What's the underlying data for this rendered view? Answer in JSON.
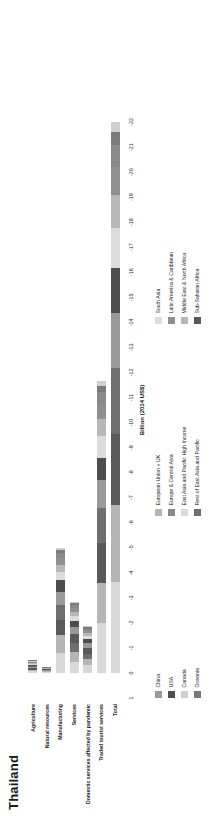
{
  "title": "Thailand",
  "axis": {
    "label": "Billion (2014 US$)",
    "ticks": [
      "1",
      "0",
      "-1",
      "-2",
      "-3",
      "-4",
      "-5",
      "-6",
      "-7",
      "-8",
      "-9",
      "-10",
      "-11",
      "-12",
      "-13",
      "-14",
      "-15",
      "-16",
      "-17",
      "-18",
      "-19",
      "-20",
      "-21",
      "-22"
    ],
    "min": -22,
    "max": 1
  },
  "categories": [
    "Agriculture",
    "Natural resources",
    "Manufacturing",
    "Services",
    "Domestic services affected by pandemic",
    "Traded tourist services",
    "Total"
  ],
  "legend": {
    "columns": [
      {
        "items": [
          {
            "label": "China",
            "color": "#9a9a9a"
          },
          {
            "label": "USA",
            "color": "#4d4d4d"
          },
          {
            "label": "Canada",
            "color": "#cfcfcf"
          },
          {
            "label": "Oceania",
            "color": "#7a7a7a"
          }
        ]
      },
      {
        "items": [
          {
            "label": "European Union + UK",
            "color": "#b5b5b5"
          },
          {
            "label": "Europe & Central Asia",
            "color": "#8a8a8a"
          },
          {
            "label": "East Asia and Pacific High Income",
            "color": "#d9d9d9"
          },
          {
            "label": "Rest of East Asia and Pacific",
            "color": "#6e6e6e"
          }
        ]
      },
      {
        "items": [
          {
            "label": "South Asia",
            "color": "#dcdcdc"
          },
          {
            "label": "Latin America & Caribbean",
            "color": "#8f8f8f"
          },
          {
            "label": "Middle East & North Africa",
            "color": "#b8b8b8"
          },
          {
            "label": "Sub-Saharan Africa",
            "color": "#595959"
          }
        ]
      }
    ]
  },
  "chart_data": {
    "type": "bar",
    "orientation": "horizontal",
    "stacked": true,
    "title": "Thailand",
    "xlabel": "Billion (2014 US$)",
    "ylabel": "",
    "xlim": [
      -22,
      1
    ],
    "grid": false,
    "legend_position": "bottom",
    "categories": [
      "Agriculture",
      "Natural resources",
      "Manufacturing",
      "Services",
      "Domestic services affected by pandemic",
      "Traded tourist services",
      "Total"
    ],
    "series": [
      {
        "name": "China",
        "color": "#9a9a9a",
        "values": [
          -0.05,
          -0.02,
          -0.55,
          -0.3,
          -0.2,
          -1.1,
          -2.2
        ]
      },
      {
        "name": "USA",
        "color": "#4d4d4d",
        "values": [
          -0.04,
          -0.02,
          -0.45,
          -0.25,
          -0.15,
          -0.9,
          -1.8
        ]
      },
      {
        "name": "Canada",
        "color": "#cfcfcf",
        "values": [
          -0.01,
          -0.01,
          -0.1,
          -0.06,
          -0.04,
          -0.2,
          -0.42
        ]
      },
      {
        "name": "Oceania",
        "color": "#7a7a7a",
        "values": [
          -0.01,
          -0.01,
          -0.12,
          -0.07,
          -0.05,
          -0.25,
          -0.51
        ]
      },
      {
        "name": "European Union + UK",
        "color": "#b5b5b5",
        "values": [
          -0.06,
          -0.03,
          -0.7,
          -0.4,
          -0.25,
          -1.6,
          -3.04
        ]
      },
      {
        "name": "Europe & Central Asia",
        "color": "#8a8a8a",
        "values": [
          -0.02,
          -0.01,
          -0.2,
          -0.12,
          -0.08,
          -0.45,
          -0.88
        ]
      },
      {
        "name": "East Asia and Pacific High Income",
        "color": "#d9d9d9",
        "values": [
          -0.07,
          -0.03,
          -0.8,
          -0.45,
          -0.3,
          -2.0,
          -3.65
        ]
      },
      {
        "name": "Rest of East Asia and Pacific",
        "color": "#6e6e6e",
        "values": [
          -0.05,
          -0.02,
          -0.6,
          -0.35,
          -0.22,
          -1.4,
          -2.64
        ]
      },
      {
        "name": "South Asia",
        "color": "#dcdcdc",
        "values": [
          -0.04,
          -0.02,
          -0.35,
          -0.2,
          -0.14,
          -0.85,
          -1.6
        ]
      },
      {
        "name": "Latin America & Caribbean",
        "color": "#8f8f8f",
        "values": [
          -0.03,
          -0.01,
          -0.25,
          -0.15,
          -0.1,
          -0.6,
          -1.14
        ]
      },
      {
        "name": "Middle East & North Africa",
        "color": "#b8b8b8",
        "values": [
          -0.03,
          -0.01,
          -0.28,
          -0.16,
          -0.11,
          -0.7,
          -1.29
        ]
      },
      {
        "name": "Sub-Saharan Africa",
        "color": "#595959",
        "values": [
          -0.06,
          -0.03,
          -0.6,
          -0.34,
          -0.22,
          -1.6,
          -2.85
        ]
      }
    ],
    "totals": [
      -0.47,
      -0.22,
      -5.0,
      -2.85,
      -1.86,
      -11.65,
      -22.02
    ]
  },
  "bar_rows": [
    {
      "category": "Agriculture",
      "segments": [
        {
          "series": "East Asia and Pacific High Income",
          "color": "#d9d9d9",
          "value": -0.07
        },
        {
          "series": "European Union + UK",
          "color": "#b5b5b5",
          "value": -0.06
        },
        {
          "series": "Sub-Saharan Africa",
          "color": "#595959",
          "value": -0.06
        },
        {
          "series": "China",
          "color": "#9a9a9a",
          "value": -0.05
        },
        {
          "series": "Rest of East Asia and Pacific",
          "color": "#6e6e6e",
          "value": -0.05
        },
        {
          "series": "USA",
          "color": "#4d4d4d",
          "value": -0.04
        },
        {
          "series": "South Asia",
          "color": "#dcdcdc",
          "value": -0.04
        },
        {
          "series": "Middle East & North Africa",
          "color": "#b8b8b8",
          "value": -0.03
        },
        {
          "series": "Latin America & Caribbean",
          "color": "#8f8f8f",
          "value": -0.03
        },
        {
          "series": "Europe & Central Asia",
          "color": "#8a8a8a",
          "value": -0.02
        },
        {
          "series": "Canada",
          "color": "#cfcfcf",
          "value": -0.01
        },
        {
          "series": "Oceania",
          "color": "#7a7a7a",
          "value": -0.01
        }
      ]
    },
    {
      "category": "Natural resources",
      "segments": [
        {
          "series": "East Asia and Pacific High Income",
          "color": "#d9d9d9",
          "value": -0.03
        },
        {
          "series": "European Union + UK",
          "color": "#b5b5b5",
          "value": -0.03
        },
        {
          "series": "Sub-Saharan Africa",
          "color": "#595959",
          "value": -0.03
        },
        {
          "series": "China",
          "color": "#9a9a9a",
          "value": -0.02
        },
        {
          "series": "Rest of East Asia and Pacific",
          "color": "#6e6e6e",
          "value": -0.02
        },
        {
          "series": "USA",
          "color": "#4d4d4d",
          "value": -0.02
        },
        {
          "series": "South Asia",
          "color": "#dcdcdc",
          "value": -0.02
        },
        {
          "series": "Middle East & North Africa",
          "color": "#b8b8b8",
          "value": -0.01
        },
        {
          "series": "Latin America & Caribbean",
          "color": "#8f8f8f",
          "value": -0.01
        },
        {
          "series": "Europe & Central Asia",
          "color": "#8a8a8a",
          "value": -0.01
        },
        {
          "series": "Canada",
          "color": "#cfcfcf",
          "value": -0.01
        },
        {
          "series": "Oceania",
          "color": "#7a7a7a",
          "value": -0.01
        }
      ]
    },
    {
      "category": "Manufacturing",
      "segments": [
        {
          "series": "East Asia and Pacific High Income",
          "color": "#d9d9d9",
          "value": -0.8
        },
        {
          "series": "European Union + UK",
          "color": "#b5b5b5",
          "value": -0.7
        },
        {
          "series": "Sub-Saharan Africa",
          "color": "#595959",
          "value": -0.6
        },
        {
          "series": "Rest of East Asia and Pacific",
          "color": "#6e6e6e",
          "value": -0.6
        },
        {
          "series": "China",
          "color": "#9a9a9a",
          "value": -0.55
        },
        {
          "series": "USA",
          "color": "#4d4d4d",
          "value": -0.45
        },
        {
          "series": "South Asia",
          "color": "#dcdcdc",
          "value": -0.35
        },
        {
          "series": "Middle East & North Africa",
          "color": "#b8b8b8",
          "value": -0.28
        },
        {
          "series": "Latin America & Caribbean",
          "color": "#8f8f8f",
          "value": -0.25
        },
        {
          "series": "Europe & Central Asia",
          "color": "#8a8a8a",
          "value": -0.2
        },
        {
          "series": "Oceania",
          "color": "#7a7a7a",
          "value": -0.12
        },
        {
          "series": "Canada",
          "color": "#cfcfcf",
          "value": -0.1
        }
      ]
    },
    {
      "category": "Services",
      "segments": [
        {
          "series": "East Asia and Pacific High Income",
          "color": "#d9d9d9",
          "value": -0.45
        },
        {
          "series": "European Union + UK",
          "color": "#b5b5b5",
          "value": -0.4
        },
        {
          "series": "Rest of East Asia and Pacific",
          "color": "#6e6e6e",
          "value": -0.35
        },
        {
          "series": "Sub-Saharan Africa",
          "color": "#595959",
          "value": -0.34
        },
        {
          "series": "China",
          "color": "#9a9a9a",
          "value": -0.3
        },
        {
          "series": "USA",
          "color": "#4d4d4d",
          "value": -0.25
        },
        {
          "series": "South Asia",
          "color": "#dcdcdc",
          "value": -0.2
        },
        {
          "series": "Middle East & North Africa",
          "color": "#b8b8b8",
          "value": -0.16
        },
        {
          "series": "Latin America & Caribbean",
          "color": "#8f8f8f",
          "value": -0.15
        },
        {
          "series": "Europe & Central Asia",
          "color": "#8a8a8a",
          "value": -0.12
        },
        {
          "series": "Oceania",
          "color": "#7a7a7a",
          "value": -0.07
        },
        {
          "series": "Canada",
          "color": "#cfcfcf",
          "value": -0.06
        }
      ]
    },
    {
      "category": "Domestic services affected by pandemic",
      "segments": [
        {
          "series": "East Asia and Pacific High Income",
          "color": "#d9d9d9",
          "value": -0.3
        },
        {
          "series": "European Union + UK",
          "color": "#b5b5b5",
          "value": -0.25
        },
        {
          "series": "Rest of East Asia and Pacific",
          "color": "#6e6e6e",
          "value": -0.22
        },
        {
          "series": "Sub-Saharan Africa",
          "color": "#595959",
          "value": -0.22
        },
        {
          "series": "China",
          "color": "#9a9a9a",
          "value": -0.2
        },
        {
          "series": "USA",
          "color": "#4d4d4d",
          "value": -0.15
        },
        {
          "series": "South Asia",
          "color": "#dcdcdc",
          "value": -0.14
        },
        {
          "series": "Middle East & North Africa",
          "color": "#b8b8b8",
          "value": -0.11
        },
        {
          "series": "Latin America & Caribbean",
          "color": "#8f8f8f",
          "value": -0.1
        },
        {
          "series": "Europe & Central Asia",
          "color": "#8a8a8a",
          "value": -0.08
        },
        {
          "series": "Oceania",
          "color": "#7a7a7a",
          "value": -0.05
        },
        {
          "series": "Canada",
          "color": "#cfcfcf",
          "value": -0.04
        }
      ]
    },
    {
      "category": "Traded tourist services",
      "segments": [
        {
          "series": "East Asia and Pacific High Income",
          "color": "#d9d9d9",
          "value": -2.0
        },
        {
          "series": "European Union + UK",
          "color": "#b5b5b5",
          "value": -1.6
        },
        {
          "series": "Sub-Saharan Africa",
          "color": "#595959",
          "value": -1.6
        },
        {
          "series": "Rest of East Asia and Pacific",
          "color": "#6e6e6e",
          "value": -1.4
        },
        {
          "series": "China",
          "color": "#9a9a9a",
          "value": -1.1
        },
        {
          "series": "USA",
          "color": "#4d4d4d",
          "value": -0.9
        },
        {
          "series": "South Asia",
          "color": "#dcdcdc",
          "value": -0.85
        },
        {
          "series": "Middle East & North Africa",
          "color": "#b8b8b8",
          "value": -0.7
        },
        {
          "series": "Latin America & Caribbean",
          "color": "#8f8f8f",
          "value": -0.6
        },
        {
          "series": "Europe & Central Asia",
          "color": "#8a8a8a",
          "value": -0.45
        },
        {
          "series": "Oceania",
          "color": "#7a7a7a",
          "value": -0.25
        },
        {
          "series": "Canada",
          "color": "#cfcfcf",
          "value": -0.2
        }
      ]
    },
    {
      "category": "Total",
      "segments": [
        {
          "series": "East Asia and Pacific High Income",
          "color": "#d9d9d9",
          "value": -3.65
        },
        {
          "series": "European Union + UK",
          "color": "#b5b5b5",
          "value": -3.04
        },
        {
          "series": "Sub-Saharan Africa",
          "color": "#595959",
          "value": -2.85
        },
        {
          "series": "Rest of East Asia and Pacific",
          "color": "#6e6e6e",
          "value": -2.64
        },
        {
          "series": "China",
          "color": "#9a9a9a",
          "value": -2.2
        },
        {
          "series": "USA",
          "color": "#4d4d4d",
          "value": -1.8
        },
        {
          "series": "South Asia",
          "color": "#dcdcdc",
          "value": -1.6
        },
        {
          "series": "Middle East & North Africa",
          "color": "#b8b8b8",
          "value": -1.29
        },
        {
          "series": "Latin America & Caribbean",
          "color": "#8f8f8f",
          "value": -1.14
        },
        {
          "series": "Europe & Central Asia",
          "color": "#8a8a8a",
          "value": -0.88
        },
        {
          "series": "Oceania",
          "color": "#7a7a7a",
          "value": -0.51
        },
        {
          "series": "Canada",
          "color": "#cfcfcf",
          "value": -0.42
        }
      ]
    }
  ]
}
